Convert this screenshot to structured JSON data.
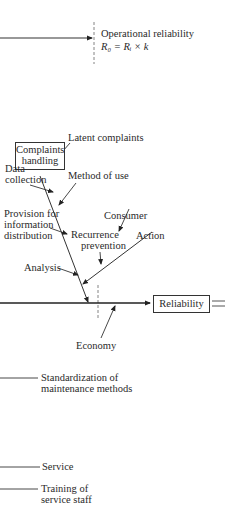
{
  "top": {
    "operational_reliability_label": "Operational reliability",
    "formula": "R₀ = Rᵢ × k"
  },
  "fishbone": {
    "head_box": "Complaints handling",
    "head_box_line1": "Complaints",
    "head_box_line2": "handling",
    "branches": {
      "latent_complaints": "Latent complaints",
      "data_collection_1": "Data",
      "data_collection_2": "collection",
      "method_of_use": "Method of use",
      "provision_1": "Provision for",
      "provision_2": "information",
      "provision_3": "distribution",
      "consumer": "Consumer",
      "recurrence_1": "Recurrence",
      "recurrence_2": "prevention",
      "action": "Action",
      "analysis": "Analysis",
      "economy": "Economy"
    },
    "result_box": "Reliability",
    "equals_sign": "="
  },
  "lower_items": {
    "standardization_1": "Standardization of",
    "standardization_2": "maintenance methods",
    "service": "Service",
    "training_1": "Training of",
    "training_2": "service staff"
  }
}
